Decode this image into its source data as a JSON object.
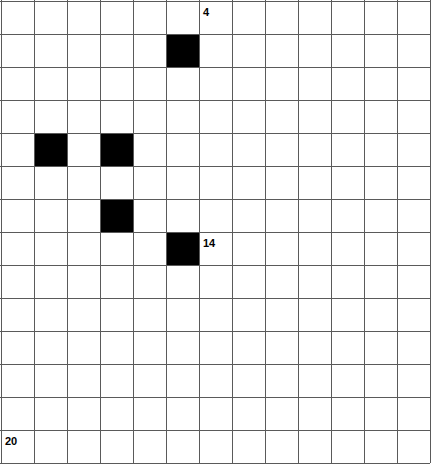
{
  "grid": {
    "columns": 13,
    "rows": 14,
    "cell_size": 33,
    "origin_x": 1,
    "origin_y": 1,
    "line_color": "#5a5a5a",
    "line_width": 1,
    "background_color": "#ffffff",
    "fill_color": "#000000"
  },
  "filled_cells": [
    {
      "col": 5,
      "row": 1
    },
    {
      "col": 1,
      "row": 4
    },
    {
      "col": 3,
      "row": 4
    },
    {
      "col": 3,
      "row": 6
    },
    {
      "col": 5,
      "row": 7
    }
  ],
  "labels": [
    {
      "text": "4",
      "col": 6,
      "row": 0,
      "name": "cell-label-4"
    },
    {
      "text": "14",
      "col": 6,
      "row": 7,
      "name": "cell-label-14"
    },
    {
      "text": "20",
      "col": 0,
      "row": 13,
      "name": "cell-label-20"
    }
  ],
  "chart_data": {
    "type": "heatmap",
    "title": "",
    "xlabel": "",
    "ylabel": "",
    "grid": true,
    "legend": "none",
    "columns": 13,
    "rows": 14,
    "values_note": "Binary occupancy grid: 1 = filled (black), 0 = empty (white)",
    "matrix": [
      [
        0,
        0,
        0,
        0,
        0,
        0,
        0,
        0,
        0,
        0,
        0,
        0,
        0
      ],
      [
        0,
        0,
        0,
        0,
        0,
        1,
        0,
        0,
        0,
        0,
        0,
        0,
        0
      ],
      [
        0,
        0,
        0,
        0,
        0,
        0,
        0,
        0,
        0,
        0,
        0,
        0,
        0
      ],
      [
        0,
        0,
        0,
        0,
        0,
        0,
        0,
        0,
        0,
        0,
        0,
        0,
        0
      ],
      [
        0,
        1,
        0,
        1,
        0,
        0,
        0,
        0,
        0,
        0,
        0,
        0,
        0
      ],
      [
        0,
        0,
        0,
        0,
        0,
        0,
        0,
        0,
        0,
        0,
        0,
        0,
        0
      ],
      [
        0,
        0,
        0,
        1,
        0,
        0,
        0,
        0,
        0,
        0,
        0,
        0,
        0
      ],
      [
        0,
        0,
        0,
        0,
        0,
        1,
        0,
        0,
        0,
        0,
        0,
        0,
        0
      ],
      [
        0,
        0,
        0,
        0,
        0,
        0,
        0,
        0,
        0,
        0,
        0,
        0,
        0
      ],
      [
        0,
        0,
        0,
        0,
        0,
        0,
        0,
        0,
        0,
        0,
        0,
        0,
        0
      ],
      [
        0,
        0,
        0,
        0,
        0,
        0,
        0,
        0,
        0,
        0,
        0,
        0,
        0
      ],
      [
        0,
        0,
        0,
        0,
        0,
        0,
        0,
        0,
        0,
        0,
        0,
        0,
        0
      ],
      [
        0,
        0,
        0,
        0,
        0,
        0,
        0,
        0,
        0,
        0,
        0,
        0,
        0
      ],
      [
        0,
        0,
        0,
        0,
        0,
        0,
        0,
        0,
        0,
        0,
        0,
        0,
        0
      ]
    ],
    "annotations": [
      {
        "text": "4",
        "col": 6,
        "row": 0
      },
      {
        "text": "14",
        "col": 6,
        "row": 7
      },
      {
        "text": "20",
        "col": 0,
        "row": 13
      }
    ]
  }
}
